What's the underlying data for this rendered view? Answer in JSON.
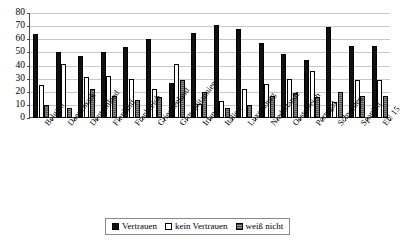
{
  "chart_data": {
    "type": "bar",
    "title": "",
    "subtitle": "",
    "xlabel": "",
    "ylabel": "",
    "ylim": [
      0,
      80
    ],
    "yticks": [
      0,
      10,
      20,
      30,
      40,
      50,
      60,
      70,
      80
    ],
    "grid": true,
    "legend_position": "bottom",
    "categories": [
      "Belgien",
      "Daenemark",
      "Deutschland",
      "Finnland",
      "Frankreich",
      "Griechenland",
      "Grossbritannien",
      "Irland",
      "Italien",
      "Luxemburg",
      "Niederlande",
      "Oesterreich",
      "Portugal",
      "Schweden",
      "Spanien",
      "EU 15"
    ],
    "series": [
      {
        "name": "Vertrauen",
        "color": "#111111",
        "values": [
          64,
          50,
          47,
          50,
          54,
          60,
          27,
          65,
          71,
          68,
          57,
          49,
          44,
          69,
          55,
          55
        ]
      },
      {
        "name": "kein Vertrauen",
        "color": "#ffffff",
        "values": [
          25,
          41,
          31,
          32,
          30,
          22,
          41,
          11,
          13,
          22,
          26,
          30,
          36,
          12,
          29,
          29
        ]
      },
      {
        "name": "weiß nicht",
        "color": "#6e6e6e",
        "values": [
          10,
          8,
          22,
          17,
          14,
          16,
          29,
          20,
          8,
          10,
          17,
          19,
          16,
          20,
          17,
          17
        ]
      }
    ]
  },
  "legend": {
    "items": [
      {
        "label": "Vertrauen"
      },
      {
        "label": "kein Vertrauen"
      },
      {
        "label": "weiß nicht"
      }
    ]
  }
}
